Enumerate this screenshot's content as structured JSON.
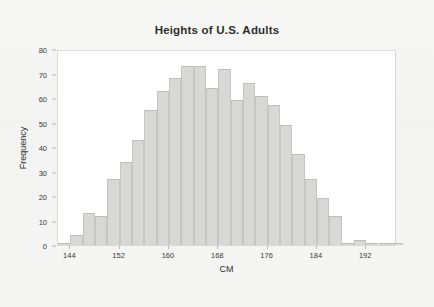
{
  "chart_data": {
    "type": "bar",
    "title": "Heights of U.S. Adults",
    "xlabel": "CM",
    "ylabel": "Frequency",
    "xlim": [
      142,
      197
    ],
    "ylim": [
      0,
      80
    ],
    "grid": false,
    "legend": null,
    "bin_width": 2,
    "x_tick_labels": [
      "144",
      "152",
      "160",
      "168",
      "176",
      "184",
      "192"
    ],
    "x_tick_values": [
      144,
      152,
      160,
      168,
      176,
      184,
      192
    ],
    "y_tick_labels": [
      "0",
      "10",
      "20",
      "30",
      "40",
      "50",
      "60",
      "70",
      "80"
    ],
    "y_tick_values": [
      0,
      10,
      20,
      30,
      40,
      50,
      60,
      70,
      80
    ],
    "bin_starts": [
      142,
      144,
      146,
      148,
      150,
      152,
      154,
      156,
      158,
      160,
      162,
      164,
      166,
      168,
      170,
      172,
      174,
      176,
      178,
      180,
      182,
      184,
      186,
      188,
      190,
      192,
      194,
      196
    ],
    "categories": [
      "142-144",
      "144-146",
      "146-148",
      "148-150",
      "150-152",
      "152-154",
      "154-156",
      "156-158",
      "158-160",
      "160-162",
      "162-164",
      "164-166",
      "166-168",
      "168-170",
      "170-172",
      "172-174",
      "174-176",
      "176-178",
      "178-180",
      "180-182",
      "182-184",
      "184-186",
      "186-188",
      "188-190",
      "190-192",
      "192-194",
      "194-196",
      "196-198"
    ],
    "values": [
      1,
      4,
      13,
      12,
      27,
      34,
      43,
      55,
      63,
      68,
      73,
      73,
      64,
      72,
      59,
      66,
      61,
      57,
      49,
      37,
      27,
      19,
      12,
      1,
      2,
      1,
      1,
      1
    ]
  },
  "colors": {
    "bar_fill": "#d8d8d6",
    "bar_edge": "#c6c6c4",
    "plot_background": "#ffffff",
    "page_background": "#f5f5f3",
    "text": "#2e2e2e",
    "axis": "#b8b8b6"
  }
}
